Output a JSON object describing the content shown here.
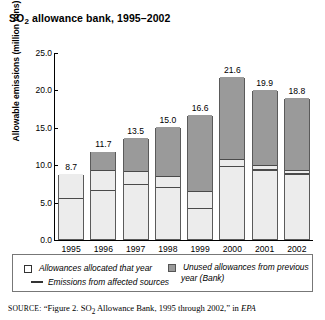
{
  "title": {
    "prefix": "SO",
    "sub": "2",
    "suffix": " allowance bank, 1995–2002"
  },
  "axes": {
    "ylabel": "Allowable emissions (million tons)",
    "yticks": [
      "0.0",
      "5.0",
      "10.0",
      "15.0",
      "20.0",
      "25.0"
    ],
    "ymin": 0,
    "ymax": 25
  },
  "legend": {
    "allocated": "Allowances allocated that year",
    "bank_line1": "Unused allowances from previous",
    "bank_line2": "year (Bank)",
    "emissions": "Emissions from affected sources"
  },
  "source": {
    "label": "SOURCE:",
    "text_before": " “Figure 2. SO",
    "sub": "2",
    "text_mid": " Allowance Bank, 1995 through 2002,” in ",
    "italic": "EPA"
  },
  "colors": {
    "bank": "#9a9a9a",
    "allocated": "#ececec",
    "emissions_line": "#4a4a4a",
    "border": "#5a5a5a"
  },
  "chart_data": {
    "type": "bar",
    "xlabel": "",
    "ylabel": "Allowable emissions (million tons)",
    "ylim": [
      0,
      25
    ],
    "yticks": [
      0.0,
      5.0,
      10.0,
      15.0,
      20.0,
      25.0
    ],
    "grid": false,
    "legend_position": "bottom",
    "stacked": true,
    "categories": [
      "1995",
      "1996",
      "1997",
      "1998",
      "1999",
      "2000",
      "2001",
      "2002"
    ],
    "totals": [
      8.7,
      11.7,
      13.5,
      15.0,
      16.6,
      21.6,
      19.9,
      18.8
    ],
    "total_labels": [
      "8.7",
      "11.7",
      "13.5",
      "15.0",
      "16.6",
      "21.6",
      "19.9",
      "18.8"
    ],
    "series": [
      {
        "name": "Allowances allocated that year",
        "color": "#ececec",
        "values": [
          8.7,
          9.1,
          9.0,
          8.3,
          6.3,
          10.5,
          9.7,
          9.1
        ]
      },
      {
        "name": "Unused allowances from previous year (Bank)",
        "color": "#9a9a9a",
        "values": [
          0.0,
          2.6,
          4.5,
          6.7,
          10.3,
          11.1,
          10.2,
          9.7
        ]
      }
    ],
    "overlay_line": {
      "name": "Emissions from affected sources",
      "color": "#4a4a4a",
      "style": "horizontal-marker-per-bar",
      "values": [
        5.3,
        6.4,
        7.2,
        6.8,
        4.0,
        9.6,
        9.1,
        8.6
      ]
    }
  },
  "bars": [
    {
      "year": "1995",
      "label": "8.7",
      "total": 8.7,
      "alloc": 8.7,
      "bank": 0.0,
      "emissions": 5.3
    },
    {
      "year": "1996",
      "label": "11.7",
      "total": 11.7,
      "alloc": 9.1,
      "bank": 2.6,
      "emissions": 6.4
    },
    {
      "year": "1997",
      "label": "13.5",
      "total": 13.5,
      "alloc": 9.0,
      "bank": 4.5,
      "emissions": 7.2
    },
    {
      "year": "1998",
      "label": "15.0",
      "total": 15.0,
      "alloc": 8.3,
      "bank": 6.7,
      "emissions": 6.8
    },
    {
      "year": "1999",
      "label": "16.6",
      "total": 16.6,
      "alloc": 6.3,
      "bank": 10.3,
      "emissions": 4.0
    },
    {
      "year": "2000",
      "label": "21.6",
      "total": 21.6,
      "alloc": 10.5,
      "bank": 11.1,
      "emissions": 9.6
    },
    {
      "year": "2001",
      "label": "19.9",
      "total": 19.9,
      "alloc": 9.7,
      "bank": 10.2,
      "emissions": 9.1
    },
    {
      "year": "2002",
      "label": "18.8",
      "total": 18.8,
      "alloc": 9.1,
      "bank": 9.7,
      "emissions": 8.6
    }
  ]
}
